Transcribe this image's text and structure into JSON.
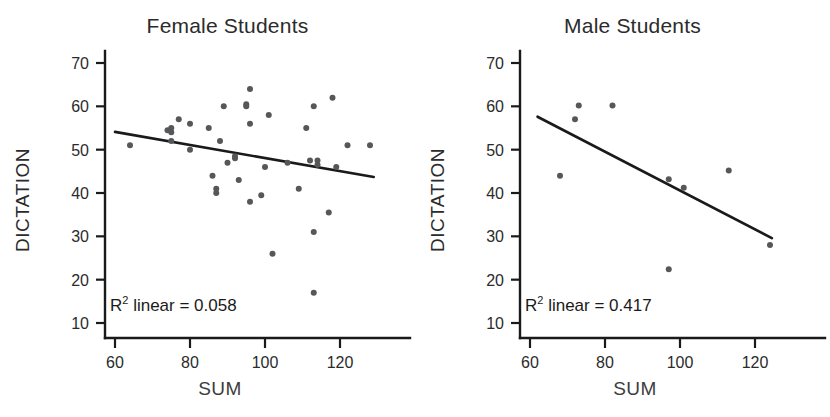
{
  "figure": {
    "panels": [
      {
        "id": "female",
        "title": "Female Students",
        "r2_label": "R² linear = 0.058",
        "r2_prefix": "R",
        "r2_sup": "2",
        "r2_rest": " linear = 0.058",
        "x_axis_title": "SUM",
        "y_axis_title": "DICTATION"
      },
      {
        "id": "male",
        "title": "Male Students",
        "r2_label": "R² linear = 0.417",
        "r2_prefix": "R",
        "r2_sup": "2",
        "r2_rest": " linear = 0.417",
        "x_axis_title": "SUM",
        "y_axis_title": "DICTATION"
      }
    ]
  },
  "chart_data": [
    {
      "type": "scatter",
      "title": "Female Students",
      "xlabel": "SUM",
      "ylabel": "DICTATION",
      "xlim": [
        55,
        133
      ],
      "ylim": [
        6,
        74
      ],
      "xticks": [
        60,
        80,
        100,
        120
      ],
      "yticks": [
        10,
        20,
        30,
        40,
        50,
        60,
        70
      ],
      "grid": false,
      "legend": "none",
      "annotation": "R² linear = 0.058",
      "r_squared": 0.058,
      "points": [
        {
          "x": 64,
          "y": 51.0
        },
        {
          "x": 74,
          "y": 54.5
        },
        {
          "x": 75,
          "y": 54.0
        },
        {
          "x": 75,
          "y": 55.0
        },
        {
          "x": 75,
          "y": 52.0
        },
        {
          "x": 77,
          "y": 57.0
        },
        {
          "x": 80,
          "y": 56.0
        },
        {
          "x": 80,
          "y": 50.0
        },
        {
          "x": 85,
          "y": 55.0
        },
        {
          "x": 86,
          "y": 44.0
        },
        {
          "x": 87,
          "y": 41.0
        },
        {
          "x": 87,
          "y": 40.0
        },
        {
          "x": 88,
          "y": 52.0
        },
        {
          "x": 89,
          "y": 60.0
        },
        {
          "x": 90,
          "y": 47.0
        },
        {
          "x": 92,
          "y": 48.5
        },
        {
          "x": 92,
          "y": 48.0
        },
        {
          "x": 93,
          "y": 43.0
        },
        {
          "x": 95,
          "y": 60.5
        },
        {
          "x": 95,
          "y": 60.0
        },
        {
          "x": 96,
          "y": 64.0
        },
        {
          "x": 96,
          "y": 38.0
        },
        {
          "x": 96,
          "y": 56.0
        },
        {
          "x": 99,
          "y": 39.5
        },
        {
          "x": 100,
          "y": 46.0
        },
        {
          "x": 101,
          "y": 58.0
        },
        {
          "x": 102,
          "y": 26.0
        },
        {
          "x": 106,
          "y": 47.0
        },
        {
          "x": 109,
          "y": 41.0
        },
        {
          "x": 111,
          "y": 55.0
        },
        {
          "x": 112,
          "y": 47.5
        },
        {
          "x": 113,
          "y": 60.0
        },
        {
          "x": 113,
          "y": 31.0
        },
        {
          "x": 113,
          "y": 17.0
        },
        {
          "x": 114,
          "y": 47.5
        },
        {
          "x": 114,
          "y": 46.5
        },
        {
          "x": 117,
          "y": 35.5
        },
        {
          "x": 118,
          "y": 62.0
        },
        {
          "x": 119,
          "y": 46.0
        },
        {
          "x": 122,
          "y": 51.0
        },
        {
          "x": 128,
          "y": 51.0
        }
      ],
      "fit_line": {
        "x0": 60.0,
        "y0": 54.1,
        "x1": 129.0,
        "y1": 43.7
      }
    },
    {
      "type": "scatter",
      "title": "Male Students",
      "xlabel": "SUM",
      "ylabel": "DICTATION",
      "xlim": [
        55,
        133
      ],
      "ylim": [
        6,
        74
      ],
      "xticks": [
        60,
        80,
        100,
        120
      ],
      "yticks": [
        10,
        20,
        30,
        40,
        50,
        60,
        70
      ],
      "grid": false,
      "legend": "none",
      "annotation": "R² linear = 0.417",
      "r_squared": 0.417,
      "points": [
        {
          "x": 68,
          "y": 44.0
        },
        {
          "x": 72,
          "y": 57.0
        },
        {
          "x": 73,
          "y": 60.2
        },
        {
          "x": 82,
          "y": 60.2
        },
        {
          "x": 97,
          "y": 43.2
        },
        {
          "x": 97,
          "y": 22.4
        },
        {
          "x": 101,
          "y": 41.2
        },
        {
          "x": 113,
          "y": 45.2
        },
        {
          "x": 124,
          "y": 28.0
        }
      ],
      "fit_line": {
        "x0": 62.0,
        "y0": 57.6,
        "x1": 124.5,
        "y1": 29.6
      }
    }
  ]
}
